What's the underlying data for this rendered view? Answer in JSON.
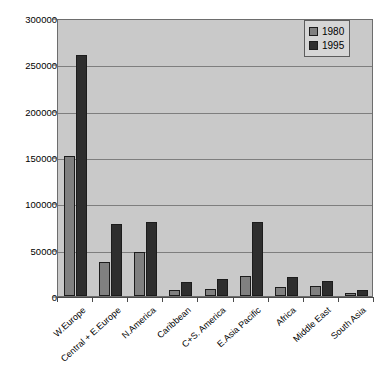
{
  "chart_data": {
    "type": "bar",
    "title": "",
    "xlabel": "",
    "ylabel": "",
    "ylim": [
      0,
      300000
    ],
    "ytick_values": [
      0,
      50000,
      100000,
      150000,
      200000,
      250000,
      300000
    ],
    "ytick_labels": [
      "0",
      "50000",
      "100000",
      "150000",
      "200000",
      "250000",
      "300000"
    ],
    "grid": true,
    "legend_position": "top-right",
    "categories": [
      "W.Europe",
      "Central + E.Europe",
      "N.America",
      "Caribbean",
      "C+S. America",
      "E.Asia Pacific",
      "Africa",
      "Middle East",
      "South Asia"
    ],
    "series": [
      {
        "name": "1980",
        "color": "#808080",
        "values": [
          151000,
          37000,
          48000,
          7000,
          8000,
          22000,
          10000,
          11000,
          3000
        ]
      },
      {
        "name": "1995",
        "color": "#2e2e2e",
        "values": [
          260000,
          78000,
          80000,
          15000,
          18000,
          80000,
          21000,
          16000,
          6000
        ]
      }
    ]
  },
  "colors": {
    "plot_background": "#c9c9c9",
    "page_background": "#ffffff",
    "gridline": "#7e7e7e",
    "axis": "#4a4a4a",
    "legend_background": "#d6d6d6",
    "bar_outline": "#1c1c1c"
  }
}
